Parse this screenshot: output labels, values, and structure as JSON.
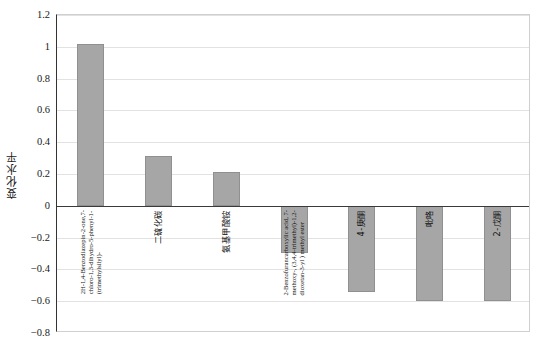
{
  "chart_data": {
    "type": "bar",
    "title": "",
    "subtitle": "",
    "xlabel": "",
    "ylabel": "变化水平",
    "ylim": [
      -0.8,
      1.2
    ],
    "ytick_labels": [
      "1.2",
      "1",
      "0.8",
      "0.6",
      "0.4",
      "0.2",
      "0",
      "−0.2",
      "−0.4",
      "−0.6",
      "−0.8"
    ],
    "ytick_values": [
      1.2,
      1.0,
      0.8,
      0.6,
      0.4,
      0.2,
      0,
      -0.2,
      -0.4,
      -0.6,
      -0.8
    ],
    "grid": true,
    "legend": "none",
    "bar_color": "#a6a6a6",
    "bar_edge_color": "#909090",
    "gridline_color": "#e2e2e2",
    "axis_color": "#333333",
    "categories": [
      "2H-1,4-Benzodiazepin-2-one,7-chloro-1,3-dihydro-5-phenyl-1-(trimethylsilyl)-",
      "二硫化碳",
      "氨基甲酸铵",
      "2-Benzofurancarboxylic acid, 7-methoxy-, (3,4,4-trimethyl)-1,2-dioxetan-3-yl ) methyl ester",
      "4-庚酮",
      "吡咯",
      "2-戊酮"
    ],
    "category_label_lines": [
      [
        "2H-1,4-Benzodiazepin-2-one,7-",
        "chloro-1,3-dihydro-5-phenyl-1-",
        "(trimethylsilyl)-"
      ],
      [
        "二硫化碳"
      ],
      [
        "氨基甲酸铵"
      ],
      [
        "2-Benzofurancarboxylic acid, 7-",
        "methoxy-, (3,4,4-trimethyl)-1,2-",
        "dioxetan-3-yl ) methyl ester"
      ],
      [
        "4-庚酮"
      ],
      [
        "吡咯"
      ],
      [
        "2-戊酮"
      ]
    ],
    "values": [
      1.02,
      0.315,
      0.21,
      -0.3,
      -0.54,
      -0.6,
      -0.6
    ],
    "bars": [
      {
        "category": "2H-1,4-Benzodiazepin-2-one,7-chloro-1,3-dihydro-5-phenyl-1-(trimethylsilyl)-",
        "value": 1.02
      },
      {
        "category": "二硫化碳",
        "value": 0.315
      },
      {
        "category": "氨基甲酸铵",
        "value": 0.21
      },
      {
        "category": "2-Benzofurancarboxylic acid, 7-methoxy-, (3,4,4-trimethyl)-1,2-dioxetan-3-yl ) methyl ester",
        "value": -0.3
      },
      {
        "category": "4-庚酮",
        "value": -0.54
      },
      {
        "category": "吡咯",
        "value": -0.6
      },
      {
        "category": "2-戊酮",
        "value": -0.6
      }
    ]
  }
}
